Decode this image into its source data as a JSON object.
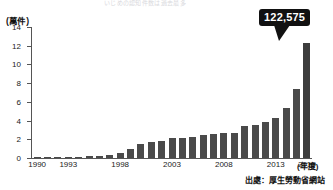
{
  "header": {
    "cut_off_title": "いじめの認知件数は過去最多"
  },
  "chart_data": {
    "type": "bar",
    "title": "",
    "unit_label": "(萬件)",
    "xlabel": "(年度)",
    "ylabel": "",
    "ylim": [
      0,
      14
    ],
    "yticks": [
      0,
      2,
      4,
      6,
      8,
      10,
      12,
      14
    ],
    "grid": false,
    "legend": null,
    "bar_color": "#4a4a4a",
    "categories": [
      "1990",
      "1991",
      "1992",
      "1993",
      "1994",
      "1995",
      "1996",
      "1997",
      "1998",
      "1999",
      "2000",
      "2001",
      "2002",
      "2003",
      "2004",
      "2005",
      "2006",
      "2007",
      "2008",
      "2009",
      "2010",
      "2011",
      "2012",
      "2013",
      "2014",
      "2015",
      "2016"
    ],
    "values": [
      0.12,
      0.1,
      0.09,
      0.09,
      0.13,
      0.18,
      0.25,
      0.32,
      0.55,
      0.96,
      1.52,
      1.71,
      1.82,
      2.1,
      2.13,
      2.21,
      2.42,
      2.6,
      2.68,
      2.7,
      3.45,
      3.55,
      3.88,
      4.3,
      5.35,
      7.4,
      12.26
    ],
    "highlight": {
      "category": "2016",
      "label": "122,575",
      "value": 12.2575
    },
    "xtick_labels": [
      {
        "label": "1990",
        "index": 0
      },
      {
        "label": "1993",
        "index": 3
      },
      {
        "label": "1998",
        "index": 8
      },
      {
        "label": "2003",
        "index": 13
      },
      {
        "label": "2008",
        "index": 18
      },
      {
        "label": "2013",
        "index": 23
      },
      {
        "label": "2016",
        "index": 26
      }
    ]
  },
  "footer": {
    "source": "出處：厚生勞動省網站"
  }
}
